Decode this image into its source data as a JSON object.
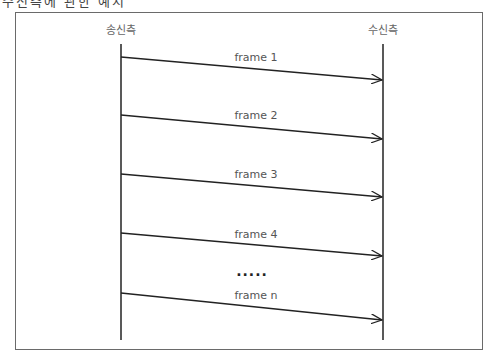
{
  "title_cut": "수신측에 관한 예시",
  "participants": {
    "sender": {
      "label": "송신측",
      "x": 121
    },
    "receiver": {
      "label": "수신측",
      "x": 383
    }
  },
  "lifeline": {
    "top": 44,
    "bottom": 340
  },
  "messages": [
    {
      "label": "frame 1",
      "y_start": 57,
      "y_end": 80
    },
    {
      "label": "frame 2",
      "y_start": 115,
      "y_end": 139
    },
    {
      "label": "frame 3",
      "y_start": 174,
      "y_end": 197
    },
    {
      "label": "frame 4",
      "y_start": 233,
      "y_end": 256
    },
    {
      "label": "frame n",
      "y_start": 293,
      "y_end": 320
    }
  ],
  "ellipsis": "....."
}
